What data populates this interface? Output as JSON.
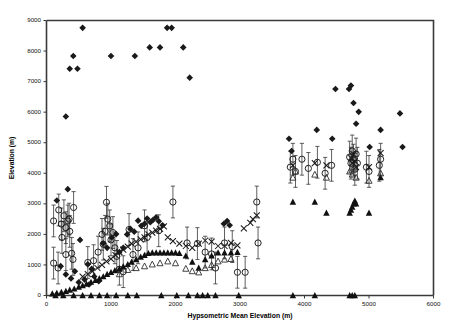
{
  "chart_data": {
    "type": "scatter",
    "title": "",
    "xlabel": "Hypsometric Mean Elevation (m)",
    "ylabel": "Elevation (m)",
    "xlim": [
      0,
      6000
    ],
    "ylim": [
      0,
      9000
    ],
    "xticks": [
      0,
      1000,
      2000,
      3000,
      4000,
      5000,
      6000
    ],
    "yticks": [
      0,
      1000,
      2000,
      3000,
      4000,
      5000,
      6000,
      7000,
      8000,
      9000
    ],
    "grid": false,
    "legend": "none",
    "error_bars": "vertical, on open-circle series",
    "marker_color": "#1a1a1a",
    "series": [
      {
        "name": "Maximum Elevation",
        "marker": "filled-diamond",
        "points": [
          [
            300,
            5860
          ],
          [
            360,
            7420
          ],
          [
            415,
            7840
          ],
          [
            480,
            7420
          ],
          [
            560,
            8760
          ],
          [
            1000,
            7840
          ],
          [
            1370,
            7840
          ],
          [
            1600,
            8120
          ],
          [
            1760,
            8120
          ],
          [
            1870,
            8760
          ],
          [
            1940,
            8760
          ],
          [
            2120,
            8120
          ],
          [
            2220,
            7130
          ],
          [
            160,
            3110
          ],
          [
            330,
            3480
          ],
          [
            520,
            1820
          ],
          [
            640,
            1020
          ],
          [
            700,
            870
          ],
          [
            880,
            1700
          ],
          [
            940,
            1560
          ],
          [
            1010,
            1900
          ],
          [
            1080,
            2010
          ],
          [
            1130,
            1420
          ],
          [
            1190,
            1560
          ],
          [
            1250,
            2000
          ],
          [
            1300,
            2180
          ],
          [
            1360,
            2090
          ],
          [
            1420,
            2450
          ],
          [
            1470,
            2280
          ],
          [
            1520,
            2350
          ],
          [
            1560,
            2520
          ],
          [
            1610,
            2400
          ],
          [
            1650,
            2470
          ],
          [
            1700,
            2560
          ],
          [
            1740,
            2430
          ],
          [
            1800,
            2300
          ],
          [
            2750,
            2350
          ],
          [
            2800,
            2440
          ],
          [
            2840,
            2300
          ],
          [
            3760,
            5130
          ],
          [
            3800,
            4730
          ],
          [
            4190,
            5420
          ],
          [
            4430,
            5130
          ],
          [
            4480,
            6760
          ],
          [
            4690,
            6760
          ],
          [
            4720,
            6870
          ],
          [
            4760,
            6300
          ],
          [
            4800,
            5620
          ],
          [
            4840,
            6010
          ],
          [
            5010,
            4860
          ],
          [
            5180,
            5420
          ],
          [
            5480,
            5960
          ],
          [
            5520,
            4860
          ],
          [
            220,
            960
          ],
          [
            300,
            690
          ],
          [
            380,
            560
          ],
          [
            440,
            790
          ],
          [
            500,
            430
          ],
          [
            590,
            520
          ],
          [
            660,
            360
          ],
          [
            740,
            620
          ],
          [
            810,
            470
          ]
        ]
      },
      {
        "name": "Mean Elevation with range",
        "marker": "open-circle",
        "points": [
          [
            110,
            2440
          ],
          [
            110,
            1060
          ],
          [
            190,
            2800
          ],
          [
            230,
            2340
          ],
          [
            270,
            2610
          ],
          [
            300,
            1340
          ],
          [
            330,
            2440
          ],
          [
            360,
            2100
          ],
          [
            390,
            1380
          ],
          [
            410,
            1180
          ],
          [
            180,
            900
          ],
          [
            240,
            1900
          ],
          [
            300,
            2220
          ],
          [
            350,
            2500
          ],
          [
            420,
            2880
          ],
          [
            640,
            1080
          ],
          [
            730,
            1140
          ],
          [
            800,
            1420
          ],
          [
            860,
            2000
          ],
          [
            880,
            1680
          ],
          [
            910,
            2100
          ],
          [
            930,
            3050
          ],
          [
            950,
            2500
          ],
          [
            980,
            2280
          ],
          [
            1000,
            1820
          ],
          [
            1030,
            2060
          ],
          [
            1060,
            1560
          ],
          [
            1090,
            1280
          ],
          [
            1130,
            860
          ],
          [
            1190,
            780
          ],
          [
            1280,
            2160
          ],
          [
            1340,
            1340
          ],
          [
            1420,
            1560
          ],
          [
            1520,
            2280
          ],
          [
            1560,
            1900
          ],
          [
            1740,
            2120
          ],
          [
            1960,
            3060
          ],
          [
            2180,
            1720
          ],
          [
            2340,
            1700
          ],
          [
            2460,
            1420
          ],
          [
            2560,
            1360
          ],
          [
            2620,
            900
          ],
          [
            2760,
            1720
          ],
          [
            2880,
            1600
          ],
          [
            2960,
            760
          ],
          [
            3080,
            760
          ],
          [
            3260,
            3060
          ],
          [
            3280,
            1720
          ],
          [
            3780,
            4200
          ],
          [
            3820,
            4460
          ],
          [
            3860,
            4060
          ],
          [
            3960,
            4460
          ],
          [
            4060,
            4160
          ],
          [
            4200,
            4360
          ],
          [
            4320,
            4000
          ],
          [
            4420,
            4260
          ],
          [
            4700,
            4530
          ],
          [
            4720,
            4330
          ],
          [
            4740,
            4730
          ],
          [
            4760,
            4430
          ],
          [
            4780,
            4130
          ],
          [
            4800,
            4630
          ],
          [
            4820,
            4330
          ],
          [
            4960,
            4200
          ],
          [
            5000,
            4060
          ],
          [
            5160,
            4260
          ],
          [
            5180,
            4460
          ]
        ],
        "err_low": 520,
        "err_high": 520
      },
      {
        "name": "Median Elevation",
        "marker": "cross-x",
        "points": [
          [
            560,
            620
          ],
          [
            640,
            700
          ],
          [
            710,
            790
          ],
          [
            790,
            900
          ],
          [
            860,
            1000
          ],
          [
            930,
            1120
          ],
          [
            1000,
            1200
          ],
          [
            1070,
            1320
          ],
          [
            1130,
            1420
          ],
          [
            1190,
            1500
          ],
          [
            1260,
            1600
          ],
          [
            1320,
            1700
          ],
          [
            1390,
            1760
          ],
          [
            1460,
            1840
          ],
          [
            1520,
            1900
          ],
          [
            1580,
            2000
          ],
          [
            1640,
            2060
          ],
          [
            1700,
            2120
          ],
          [
            1760,
            2180
          ],
          [
            1820,
            2260
          ],
          [
            1880,
            1900
          ],
          [
            1960,
            1780
          ],
          [
            2060,
            1700
          ],
          [
            2160,
            1620
          ],
          [
            2260,
            1560
          ],
          [
            2360,
            1700
          ],
          [
            2460,
            1800
          ],
          [
            2560,
            1760
          ],
          [
            2660,
            1620
          ],
          [
            2760,
            1620
          ],
          [
            2860,
            1720
          ],
          [
            2960,
            1640
          ],
          [
            3060,
            2200
          ],
          [
            3160,
            2380
          ],
          [
            3200,
            2500
          ],
          [
            3260,
            2620
          ],
          [
            3820,
            4260
          ],
          [
            4160,
            4330
          ],
          [
            4340,
            4260
          ],
          [
            4720,
            4500
          ],
          [
            4740,
            4330
          ],
          [
            4760,
            4630
          ],
          [
            4780,
            4400
          ],
          [
            4800,
            4200
          ],
          [
            5000,
            4200
          ],
          [
            5180,
            4660
          ]
        ]
      },
      {
        "name": "Minimum Elevation",
        "marker": "filled-triangle",
        "points": [
          [
            90,
            60
          ],
          [
            160,
            80
          ],
          [
            230,
            110
          ],
          [
            300,
            140
          ],
          [
            360,
            180
          ],
          [
            430,
            220
          ],
          [
            500,
            280
          ],
          [
            560,
            330
          ],
          [
            620,
            380
          ],
          [
            690,
            440
          ],
          [
            760,
            500
          ],
          [
            820,
            560
          ],
          [
            880,
            620
          ],
          [
            940,
            700
          ],
          [
            1000,
            760
          ],
          [
            1060,
            820
          ],
          [
            1130,
            880
          ],
          [
            1190,
            950
          ],
          [
            1260,
            1020
          ],
          [
            1320,
            1100
          ],
          [
            1390,
            1180
          ],
          [
            1460,
            1260
          ],
          [
            1520,
            1320
          ],
          [
            1580,
            1380
          ],
          [
            1640,
            1400
          ],
          [
            1700,
            1400
          ],
          [
            1760,
            1400
          ],
          [
            1820,
            1400
          ],
          [
            1880,
            1400
          ],
          [
            1940,
            1400
          ],
          [
            2000,
            1400
          ],
          [
            2060,
            1380
          ],
          [
            2160,
            1300
          ],
          [
            2260,
            1100
          ],
          [
            2360,
            900
          ],
          [
            2460,
            1180
          ],
          [
            2560,
            1300
          ],
          [
            2660,
            1400
          ],
          [
            2760,
            1400
          ],
          [
            2860,
            1400
          ],
          [
            2960,
            1420
          ],
          [
            3820,
            3060
          ],
          [
            4160,
            3060
          ],
          [
            4340,
            2700
          ],
          [
            4700,
            2700
          ],
          [
            4720,
            2800
          ],
          [
            4740,
            2900
          ],
          [
            4760,
            3000
          ],
          [
            4780,
            3100
          ],
          [
            4800,
            3000
          ],
          [
            5000,
            2700
          ],
          [
            5180,
            3860
          ],
          [
            140,
            0
          ],
          [
            260,
            0
          ],
          [
            420,
            0
          ],
          [
            560,
            0
          ],
          [
            690,
            0
          ],
          [
            820,
            0
          ],
          [
            940,
            0
          ],
          [
            1080,
            0
          ],
          [
            1260,
            0
          ],
          [
            1400,
            0
          ],
          [
            1780,
            0
          ],
          [
            2020,
            0
          ],
          [
            2200,
            0
          ],
          [
            2340,
            0
          ],
          [
            2420,
            0
          ],
          [
            2500,
            0
          ],
          [
            2620,
            0
          ],
          [
            2980,
            0
          ],
          [
            3820,
            0
          ],
          [
            4160,
            0
          ],
          [
            4700,
            0
          ],
          [
            4740,
            0
          ],
          [
            4780,
            0
          ]
        ]
      },
      {
        "name": "Modal Elevation",
        "marker": "open-triangle",
        "points": [
          [
            1130,
            700
          ],
          [
            1260,
            840
          ],
          [
            1390,
            900
          ],
          [
            1520,
            960
          ],
          [
            1640,
            1020
          ],
          [
            1760,
            1060
          ],
          [
            1880,
            1120
          ],
          [
            2000,
            1060
          ],
          [
            2160,
            880
          ],
          [
            2260,
            800
          ],
          [
            2360,
            760
          ],
          [
            2460,
            900
          ],
          [
            2560,
            1000
          ],
          [
            2660,
            1120
          ],
          [
            2760,
            1180
          ],
          [
            2860,
            1200
          ],
          [
            3820,
            3860
          ],
          [
            3860,
            4060
          ],
          [
            4160,
            3960
          ],
          [
            4340,
            3860
          ],
          [
            4700,
            4060
          ],
          [
            4740,
            3960
          ],
          [
            4780,
            4160
          ],
          [
            4800,
            3860
          ],
          [
            5000,
            3760
          ],
          [
            5180,
            4000
          ]
        ]
      }
    ]
  },
  "axes": {
    "y_title": "Elevation (m)",
    "x_title": "Hypsometric Mean Elevation (m)",
    "y_tick_labels": [
      "0",
      "1000",
      "2000",
      "3000",
      "4000",
      "5000",
      "6000",
      "7000",
      "8000",
      "9000"
    ],
    "x_tick_labels": [
      "0",
      "1000",
      "2000",
      "3000",
      "4000",
      "5000",
      "6000"
    ]
  }
}
